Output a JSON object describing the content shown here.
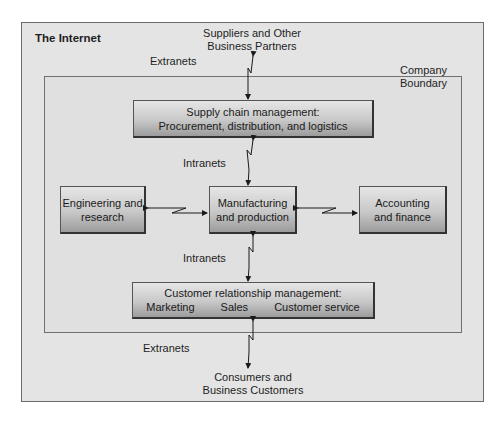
{
  "diagram": {
    "outer_label": "The Internet",
    "boundary_label_line1": "Company",
    "boundary_label_line2": "Boundary",
    "top_external": {
      "line1": "Suppliers and Other",
      "line2": "Business Partners"
    },
    "bottom_external": {
      "line1": "Consumers and",
      "line2": "Business Customers"
    },
    "connectors": {
      "top": "Extranets",
      "upper_inner": "Intranets",
      "lower_inner": "Intranets",
      "bottom": "Extranets"
    },
    "boxes": {
      "supply_chain": {
        "line1": "Supply chain management:",
        "line2": "Procurement, distribution, and logistics"
      },
      "engineering": {
        "line1": "Engineering and",
        "line2": "research"
      },
      "manufacturing": {
        "line1": "Manufacturing",
        "line2": "and production"
      },
      "accounting": {
        "line1": "Accounting",
        "line2": "and finance"
      },
      "crm": {
        "line1": "Customer relationship management:",
        "items": [
          "Marketing",
          "Sales",
          "Customer service"
        ]
      }
    },
    "colors": {
      "background": "#e4e4e4",
      "box_top": "#e6e6e6",
      "box_bottom": "#9c9c9c",
      "line": "#1a1a1a"
    }
  }
}
